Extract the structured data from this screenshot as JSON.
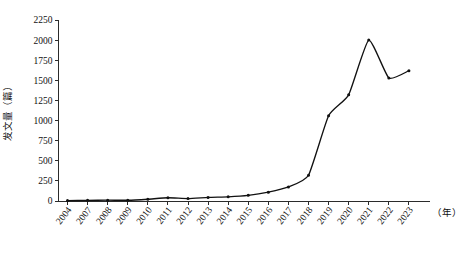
{
  "chart_data": {
    "type": "line",
    "title": "",
    "subtitle": "",
    "xlabel": "（年）",
    "ylabel": "发文量（篇）",
    "ylim": [
      0,
      2250
    ],
    "yticks": [
      0,
      250,
      500,
      750,
      1000,
      1250,
      1500,
      1750,
      2000,
      2250
    ],
    "ytick_labels": [
      "0",
      "250",
      "500",
      "750",
      "1000",
      "1250",
      "1500",
      "1750",
      "2000",
      "2250"
    ],
    "grid": false,
    "legend": "none",
    "marker": "dot",
    "line_color": "#111111",
    "categories": [
      "2004",
      "2007",
      "2008",
      "2009",
      "2010",
      "2011",
      "2012",
      "2013",
      "2014",
      "2015",
      "2016",
      "2017",
      "2018",
      "2019",
      "2020",
      "2021",
      "2022",
      "2023"
    ],
    "x": [
      2004,
      2007,
      2008,
      2009,
      2010,
      2011,
      2012,
      2013,
      2014,
      2015,
      2016,
      2017,
      2018,
      2019,
      2020,
      2021,
      2022,
      2023
    ],
    "values": [
      5,
      8,
      10,
      9,
      22,
      40,
      30,
      45,
      52,
      70,
      110,
      175,
      320,
      1060,
      1320,
      2000,
      1530,
      1620
    ],
    "series": [
      {
        "name": "发文量",
        "values": [
          5,
          8,
          10,
          9,
          22,
          40,
          30,
          45,
          52,
          70,
          110,
          175,
          320,
          1060,
          1320,
          2000,
          1530,
          1620
        ]
      }
    ],
    "annotations": []
  },
  "axes": {
    "y_unit": "发文量（篇）",
    "x_unit": "（年）"
  },
  "caption": {
    "text": ""
  }
}
